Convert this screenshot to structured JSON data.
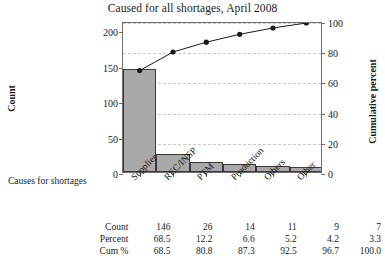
{
  "chart_data": {
    "type": "bar",
    "title": "Caused for all shortages, April 2008",
    "xlabel": "Causes for shortages",
    "ylabel": "Count",
    "y2label": "Cumulative percent",
    "categories": [
      "Supplier",
      "REC/INSP",
      "PTM",
      "Production",
      "Others",
      "Other"
    ],
    "values": [
      146,
      26,
      14,
      11,
      9,
      7
    ],
    "percent": [
      68.5,
      12.2,
      6.6,
      5.2,
      4.2,
      3.3
    ],
    "cum_percent": [
      68.5,
      80.8,
      87.3,
      92.5,
      96.7,
      100.0
    ],
    "ylim": [
      0,
      213
    ],
    "y2lim": [
      0,
      100
    ],
    "yticks": [
      0,
      50,
      100,
      150,
      200
    ],
    "y2ticks": [
      0,
      20,
      40,
      60,
      80,
      100
    ],
    "grid": true,
    "legend": "none",
    "series": [
      {
        "name": "Count",
        "type": "bar",
        "values": [
          146,
          26,
          14,
          11,
          9,
          7
        ]
      },
      {
        "name": "Cum %",
        "type": "line",
        "values": [
          68.5,
          80.8,
          87.3,
          92.5,
          96.7,
          100.0
        ]
      }
    ]
  },
  "table": {
    "rows": [
      {
        "label": "Count",
        "values": [
          "146",
          "26",
          "14",
          "11",
          "9",
          "7"
        ]
      },
      {
        "label": "Percent",
        "values": [
          "68.5",
          "12.2",
          "6.6",
          "5.2",
          "4.2",
          "3.3"
        ]
      },
      {
        "label": "Cum %",
        "values": [
          "68.5",
          "80.8",
          "87.3",
          "92.5",
          "96.7",
          "100.0"
        ]
      }
    ]
  },
  "colors": {
    "bar_fill": "#a9a9a9",
    "bar_border": "#3a3a3a",
    "line": "#1a1a1a",
    "grid": "#c9c9c9",
    "axis": "#6e6e6e"
  }
}
